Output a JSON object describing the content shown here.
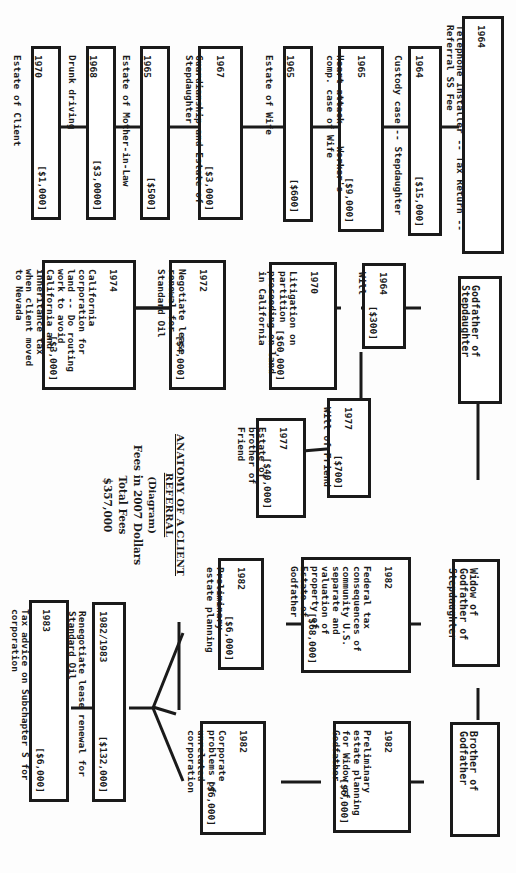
{
  "diagram": {
    "title": "ANATOMY OF A CLIENT REFERRAL",
    "subtitle": "(Diagram)",
    "fees_note": "Fees in 2007 Dollars",
    "total_label": "Total Fees",
    "total_value": "$357,000"
  },
  "people": {
    "client": {
      "year": "1964",
      "desc": "Telephone Installer -- Tax Return -- Referral SS Fee"
    },
    "godfather": {
      "label": "Godfather of Stepdaughter"
    },
    "widow": {
      "label": "Widow of Godfather of Stepdaughter"
    },
    "brother": {
      "label": "Brother of Godfather"
    }
  },
  "client_matters": [
    {
      "year": "1964",
      "desc": "Custody case -- Stepdaughter",
      "fee": "[$15,000]"
    },
    {
      "year": "1965",
      "desc": "Heart attack -- Worker's comp. case of Wife",
      "fee": "[$9,000]"
    },
    {
      "year": "1965",
      "desc": "Estate of Wife",
      "fee": "[$600]"
    },
    {
      "year": "1967",
      "desc": "Guardianship and Estate of Stepdaughter",
      "fee": "[$3,000]"
    },
    {
      "year": "1965",
      "desc": "Estate of Mother-in-Law",
      "fee": "[$500]"
    },
    {
      "year": "1968",
      "desc": "Drunk driving",
      "fee": "[$3,0000]"
    },
    {
      "year": "1970",
      "desc": "Estate of Client",
      "fee": "[$1,000]"
    }
  ],
  "godfather_matters": [
    {
      "year": "1964",
      "desc": "Will",
      "fee": "[$300]"
    },
    {
      "year": "1970",
      "desc": "Litigation on partition proceeding on land in California",
      "fee": "[$60,000]"
    },
    {
      "year": "1972",
      "desc": "Negotiate lease renewal for Standard Oil",
      "fee": "[$4,000]"
    },
    {
      "year": "1974",
      "desc": "California corporation for land -- Do routing work to avoid California and inheritance tax when client moved to Nevada",
      "fee": "[$3,000]"
    },
    {
      "year": "1977",
      "desc": "Will of Friend",
      "fee": "[$700]"
    },
    {
      "year": "1977",
      "desc": "Estate of brother of Friend",
      "fee": "[$40,000]"
    }
  ],
  "widow_matters": [
    {
      "year": "1982",
      "desc": "Federal tax consequences of community U.S. separate and valuation of property of Estate of Godfather",
      "fee": "[$68,000]"
    },
    {
      "year": "1982",
      "desc": "Preliminary estate planning",
      "fee": "[$6,000]"
    },
    {
      "year": "1982/1983",
      "desc": "Renegotiate lease renewal for Standard Oil",
      "fee": "[$132,000]"
    },
    {
      "year": "1983",
      "desc": "Tax advice on Subchapter S for corporation",
      "fee": "[$6,000]"
    }
  ],
  "brother_matters": [
    {
      "year": "1982",
      "desc": "Preliminary estate planning for Widow of Godfather",
      "fee": "[$6,000]"
    },
    {
      "year": "1982",
      "desc": "Corporate problems of unrelated corporation",
      "fee": "[$6,000]"
    }
  ]
}
